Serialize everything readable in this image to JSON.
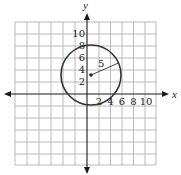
{
  "diagram": {
    "type": "coordinate-plane-circle",
    "axes": {
      "x_label": "x",
      "y_label": "y",
      "x_ticks": [
        "2",
        "4",
        "6",
        "8",
        "10"
      ],
      "y_ticks": [
        "10",
        "8",
        "6",
        "4",
        "2"
      ],
      "range": [
        -12,
        12
      ],
      "grid_step": 2,
      "grid": true
    },
    "circle": {
      "center": [
        1,
        3
      ],
      "radius": 5,
      "radius_label": "5"
    },
    "colors": {
      "grid": "#a8a8a8",
      "axis": "#1a1a1a",
      "circle": "#333333"
    }
  }
}
